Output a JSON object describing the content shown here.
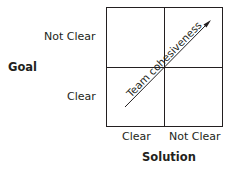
{
  "diagram": {
    "y_axis": {
      "title": "Goal",
      "ticks": [
        "Not Clear",
        "Clear"
      ]
    },
    "x_axis": {
      "title": "Solution",
      "ticks": [
        "Clear",
        "Not Clear"
      ]
    },
    "arrow_label": "Team cohesiveness",
    "colors": {
      "line": "#231f20",
      "background": "#ffffff"
    }
  }
}
